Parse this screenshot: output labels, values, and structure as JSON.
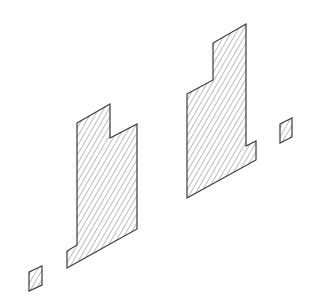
{
  "diagram": {
    "type": "isometric-hatched-sections",
    "background": "#ffffff",
    "stroke_color": "#3a3a3a",
    "hatch_color": "#8a8a8a",
    "shapes": [
      {
        "name": "left-section",
        "points": "77,123 110,104 110,138 137,124 137,229 67,268 67,251 77,245"
      },
      {
        "name": "right-section",
        "points": "187,94 213,80 213,43 246,24 246,146 256,141 256,160 187,198"
      },
      {
        "name": "small-square-left",
        "points": "29,272 42,266 42,285 29,291"
      },
      {
        "name": "small-square-right",
        "points": "280,124 292,118 292,137 280,143"
      }
    ]
  }
}
